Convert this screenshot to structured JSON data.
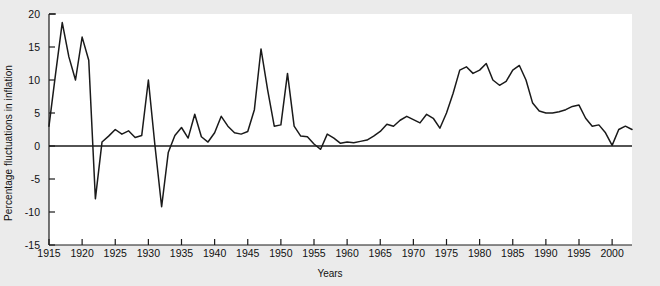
{
  "chart_data": {
    "type": "line",
    "title": "",
    "xlabel": "Years",
    "ylabel": "Percentage fluctuations in inflation",
    "xlim": [
      1915,
      2003
    ],
    "ylim": [
      -15,
      20
    ],
    "ytick_values": [
      20,
      15,
      10,
      5,
      0,
      -5,
      -10,
      -15
    ],
    "ytick_labels": [
      "20",
      "15",
      "10",
      "5",
      "0",
      "-5",
      "-10",
      "-15"
    ],
    "xtick_values": [
      1915,
      1920,
      1925,
      1930,
      1935,
      1940,
      1945,
      1950,
      1955,
      1960,
      1965,
      1970,
      1975,
      1980,
      1985,
      1990,
      1995,
      2000
    ],
    "xtick_labels": [
      "1915",
      "1920",
      "1925",
      "1930",
      "1935",
      "1940",
      "1945",
      "1950",
      "1955",
      "1960",
      "1965",
      "1970",
      "1975",
      "1980",
      "1985",
      "1990",
      "1995",
      "2000"
    ],
    "grid": false,
    "legend": false,
    "zero_line": true,
    "line_color": "#1a1a1a",
    "background_color": "#ebebeb",
    "plot_background_color": "#ffffff",
    "x": [
      1915,
      1916,
      1917,
      1918,
      1919,
      1920,
      1921,
      1922,
      1923,
      1924,
      1925,
      1926,
      1927,
      1928,
      1929,
      1930,
      1931,
      1932,
      1933,
      1934,
      1935,
      1936,
      1937,
      1938,
      1939,
      1940,
      1941,
      1942,
      1943,
      1944,
      1945,
      1946,
      1947,
      1948,
      1949,
      1950,
      1951,
      1952,
      1953,
      1954,
      1955,
      1956,
      1957,
      1958,
      1959,
      1960,
      1961,
      1962,
      1963,
      1964,
      1965,
      1966,
      1967,
      1968,
      1969,
      1970,
      1971,
      1972,
      1973,
      1974,
      1975,
      1976,
      1977,
      1978,
      1979,
      1980,
      1981,
      1982,
      1983,
      1984,
      1985,
      1986,
      1987,
      1988,
      1989,
      1990,
      1991,
      1992,
      1993,
      1994,
      1995,
      1996,
      1997,
      1998,
      1999,
      2000,
      2001,
      2002,
      2003
    ],
    "y": [
      3.0,
      11.0,
      18.7,
      13.5,
      10.0,
      16.5,
      13.0,
      -8.0,
      0.6,
      1.5,
      2.5,
      1.8,
      2.3,
      1.3,
      1.6,
      10.0,
      0.0,
      -9.2,
      -1.0,
      1.6,
      2.8,
      1.2,
      4.8,
      1.4,
      0.6,
      2.0,
      4.5,
      3.0,
      2.0,
      1.8,
      2.2,
      5.5,
      14.7,
      8.5,
      3.0,
      3.2,
      11.0,
      3.0,
      1.5,
      1.4,
      0.3,
      -0.5,
      1.8,
      1.2,
      0.4,
      0.6,
      0.5,
      0.7,
      0.9,
      1.5,
      2.2,
      3.3,
      3.0,
      3.9,
      4.5,
      4.0,
      3.5,
      4.8,
      4.2,
      2.7,
      5.0,
      8.0,
      11.5,
      12.0,
      11.0,
      11.5,
      12.5,
      10.0,
      9.2,
      9.8,
      11.5,
      12.2,
      10.0,
      6.5,
      5.3,
      5.0,
      5.0,
      5.2,
      5.5,
      6.0,
      6.2,
      4.2,
      3.0,
      3.2,
      2.0,
      0.1,
      2.5,
      3.0,
      2.5,
      2.2,
      2.8,
      3.5,
      4.0
    ]
  },
  "axis": {
    "ylabel_text": "Percentage fluctuations in inflation",
    "xlabel_text": "Years"
  }
}
